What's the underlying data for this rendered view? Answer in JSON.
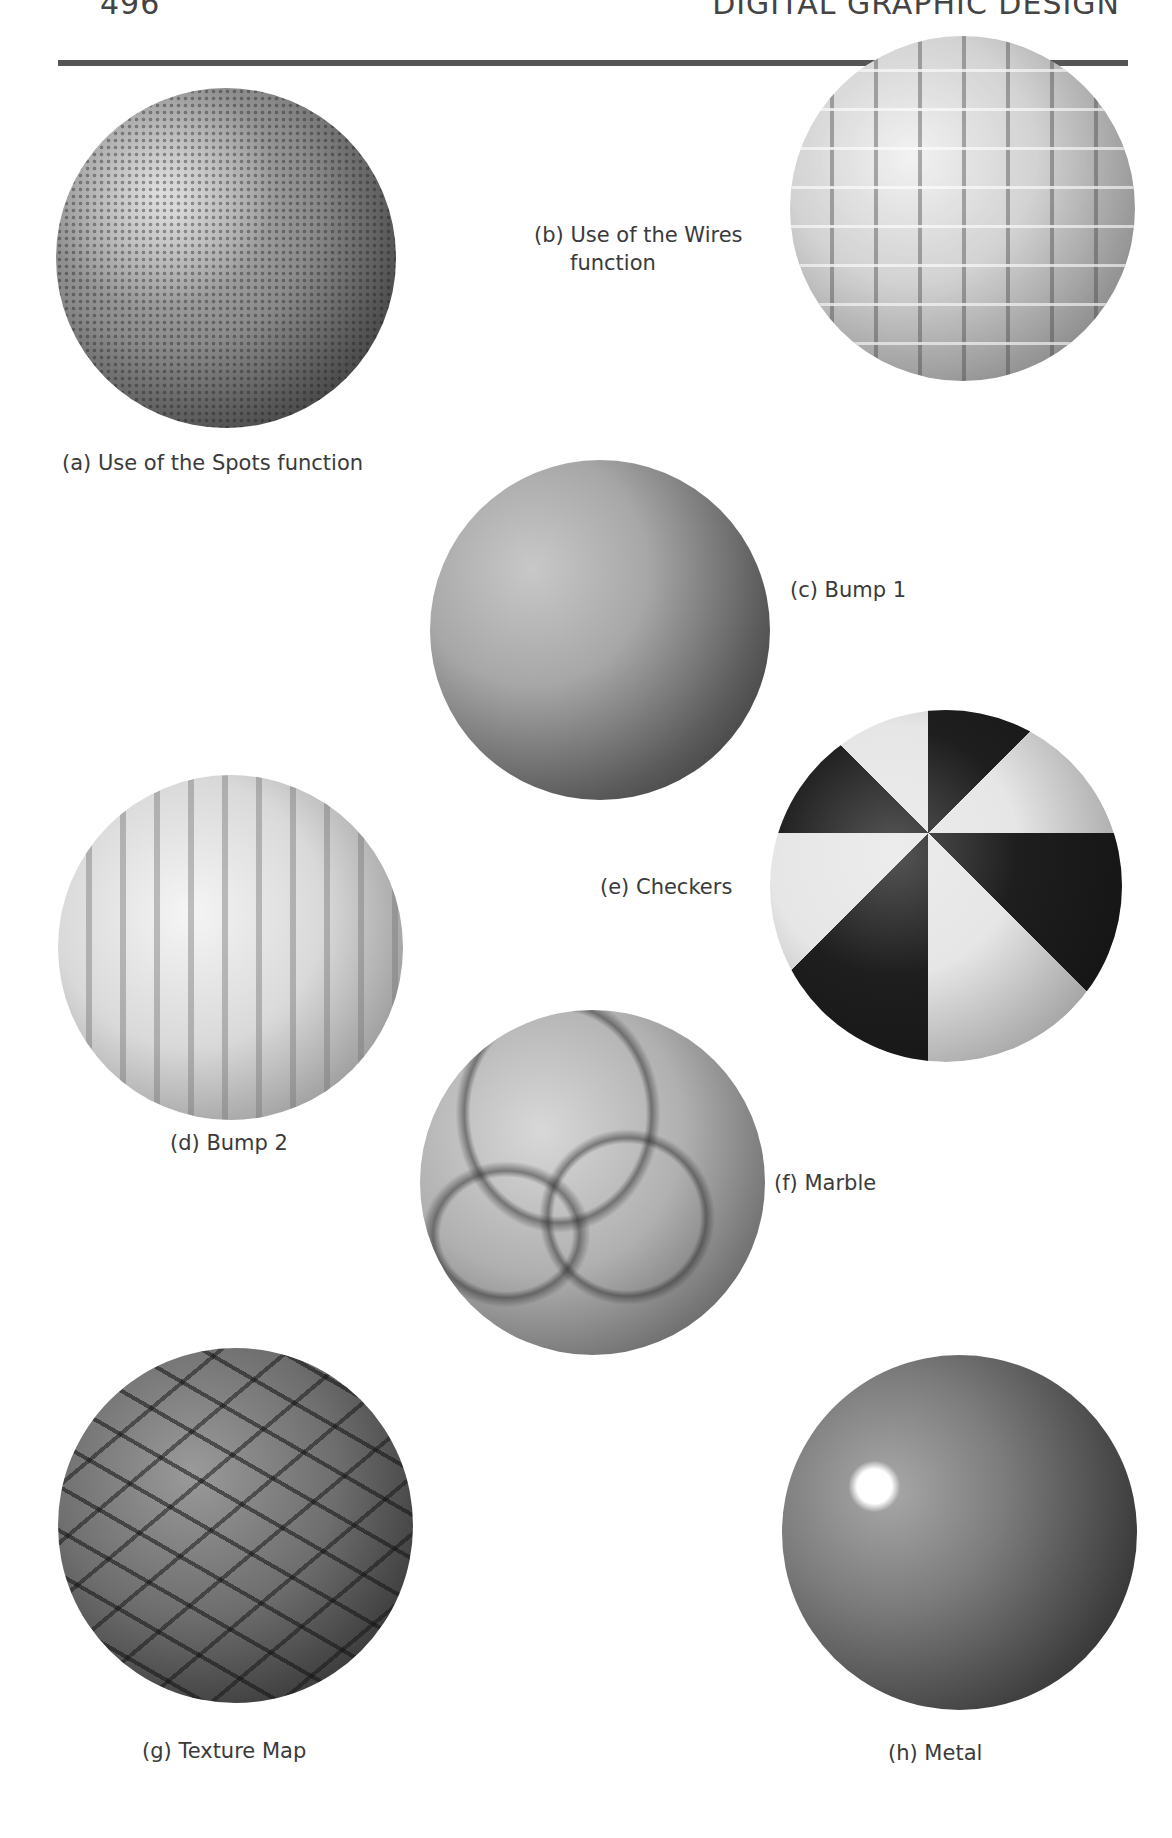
{
  "page": {
    "header_left": "496",
    "header_right": "DIGITAL GRAPHIC DESIGN"
  },
  "figures": [
    {
      "id": "a",
      "caption": "(a) Use of the Spots function"
    },
    {
      "id": "b",
      "caption_line1": "(b) Use of the Wires",
      "caption_line2": "function"
    },
    {
      "id": "c",
      "caption": "(c) Bump 1"
    },
    {
      "id": "d",
      "caption": "(d) Bump 2"
    },
    {
      "id": "e",
      "caption": "(e) Checkers"
    },
    {
      "id": "f",
      "caption": "(f) Marble"
    },
    {
      "id": "g",
      "caption": "(g) Texture Map"
    },
    {
      "id": "h",
      "caption": "(h) Metal"
    }
  ]
}
